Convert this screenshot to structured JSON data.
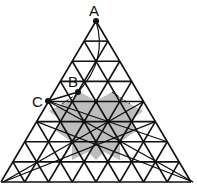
{
  "figure": {
    "type": "triangular-grid-diagram",
    "grid_divisions": 8,
    "colors": {
      "line": "#111111",
      "shade": "#bdbdbd",
      "background": "#ffffff"
    },
    "points": [
      {
        "label": "A",
        "x": 96,
        "y": 21
      },
      {
        "label": "B",
        "x": 78,
        "y": 92
      },
      {
        "label": "C",
        "x": 48,
        "y": 101
      }
    ]
  }
}
